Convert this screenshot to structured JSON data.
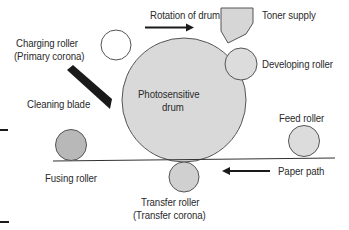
{
  "diagram": {
    "colors": {
      "drum_fill": "#d9d9d9",
      "roller_fill": "#dcdcdc",
      "fusing_fill": "#b8b8b8",
      "outline": "#555555",
      "blade": "#1a1a1a",
      "text": "#2a2a2a"
    },
    "labels": {
      "rotation": "Rotation of drum",
      "toner": "Toner supply",
      "charging_line1": "Charging roller",
      "charging_line2": "(Primary corona)",
      "developing": "Developing roller",
      "drum_line1": "Photosensitive",
      "drum_line2": "drum",
      "cleaning": "Cleaning blade",
      "feed": "Feed roller",
      "fusing": "Fusing roller",
      "paper_path": "Paper path",
      "transfer_line1": "Transfer roller",
      "transfer_line2": "(Transfer corona)"
    },
    "components": [
      {
        "name": "Photosensitive drum",
        "shape": "circle"
      },
      {
        "name": "Charging roller",
        "shape": "circle"
      },
      {
        "name": "Developing roller",
        "shape": "circle"
      },
      {
        "name": "Toner supply",
        "shape": "hopper"
      },
      {
        "name": "Cleaning blade",
        "shape": "blade"
      },
      {
        "name": "Fusing roller",
        "shape": "circle"
      },
      {
        "name": "Feed roller",
        "shape": "circle"
      },
      {
        "name": "Transfer roller",
        "shape": "circle"
      }
    ],
    "arrows": [
      {
        "label": "Rotation of drum",
        "direction": "right"
      },
      {
        "label": "Paper path",
        "direction": "left"
      }
    ]
  }
}
